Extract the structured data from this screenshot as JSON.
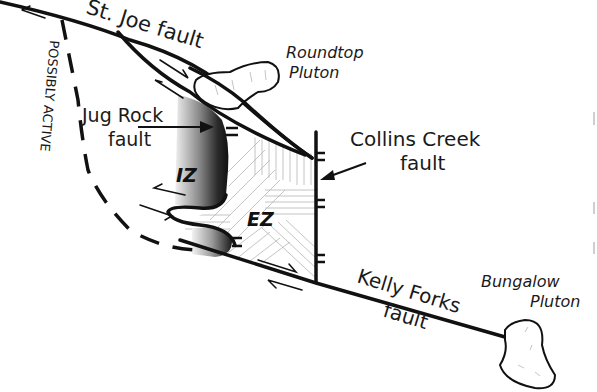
{
  "diagram": {
    "type": "geologic fault map sketch",
    "colors": {
      "background": "#ffffff",
      "line": "#111111",
      "hatch": "#b5b5b5",
      "zone_dark": "#1c1c1c",
      "zone_light": "#e6e6e6"
    },
    "labels": {
      "st_joe_fault": "St. Joe fault",
      "roundtop_line1": "Roundtop",
      "roundtop_line2": "Pluton",
      "possibly_active": "POSSIBLY ACTIVE",
      "jug_rock_line1": "Jug Rock",
      "jug_rock_line2": "fault",
      "collins_line1": "Collins Creek",
      "collins_line2": "fault",
      "iz": "IZ",
      "ez": "EZ",
      "kelly_line1": "Kelly Forks",
      "kelly_line2": "fault",
      "bungalow_line1": "Bungalow",
      "bungalow_line2": "Pluton"
    },
    "features": [
      {
        "name": "St. Joe fault",
        "kind": "strike-slip fault"
      },
      {
        "name": "Kelly Forks fault",
        "kind": "strike-slip fault"
      },
      {
        "name": "Collins Creek fault",
        "kind": "normal fault with ticks"
      },
      {
        "name": "Jug Rock fault",
        "kind": "fault bounding IZ"
      },
      {
        "name": "Possibly active fault",
        "kind": "dashed arc"
      },
      {
        "name": "Roundtop Pluton",
        "kind": "pluton outline"
      },
      {
        "name": "Bungalow Pluton",
        "kind": "pluton outline"
      },
      {
        "name": "IZ",
        "kind": "internal zone (shaded)"
      },
      {
        "name": "EZ",
        "kind": "external zone (hatched)"
      }
    ]
  }
}
